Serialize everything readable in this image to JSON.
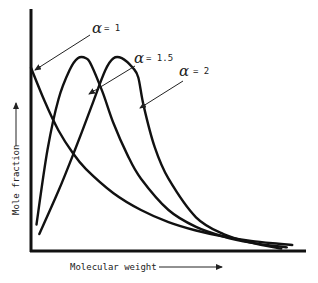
{
  "chart_data": {
    "type": "line",
    "title": "",
    "xlabel": "Molecular weight",
    "ylabel": "Mole fraction",
    "xlim": [
      0,
      1
    ],
    "ylim": [
      0,
      1
    ],
    "grid": false,
    "ticks": "none",
    "series": [
      {
        "name": "α = 1",
        "alpha_symbol": "α",
        "alpha_value": "= 1",
        "x": [
          0.0,
          0.05,
          0.1,
          0.15,
          0.2,
          0.3,
          0.4,
          0.5,
          0.6,
          0.7,
          0.8,
          0.9,
          0.95
        ],
        "y": [
          0.76,
          0.62,
          0.5,
          0.41,
          0.34,
          0.24,
          0.17,
          0.12,
          0.085,
          0.06,
          0.042,
          0.03,
          0.025
        ]
      },
      {
        "name": "α = 1.5",
        "alpha_symbol": "α",
        "alpha_value": "= 1.5",
        "x": [
          0.02,
          0.06,
          0.1,
          0.14,
          0.17,
          0.2,
          0.22,
          0.26,
          0.3,
          0.35,
          0.4,
          0.5,
          0.6,
          0.7,
          0.8,
          0.93
        ],
        "y": [
          0.11,
          0.42,
          0.63,
          0.75,
          0.8,
          0.8,
          0.77,
          0.66,
          0.53,
          0.4,
          0.3,
          0.17,
          0.1,
          0.06,
          0.035,
          0.015
        ]
      },
      {
        "name": "α = 2",
        "alpha_symbol": "α",
        "alpha_value": "= 2",
        "x": [
          0.03,
          0.1,
          0.16,
          0.22,
          0.27,
          0.3,
          0.33,
          0.37,
          0.39,
          0.41,
          0.45,
          0.5,
          0.6,
          0.7,
          0.8,
          0.91
        ],
        "y": [
          0.07,
          0.25,
          0.42,
          0.6,
          0.75,
          0.8,
          0.8,
          0.76,
          0.72,
          0.6,
          0.43,
          0.3,
          0.14,
          0.07,
          0.035,
          0.01
        ]
      }
    ],
    "annotations": [
      {
        "text": "α = 1",
        "points_to_series": "α = 1",
        "location": "top-center"
      },
      {
        "text": "α = 1.5",
        "points_to_series": "α = 1.5",
        "location": "top-right"
      },
      {
        "text": "α = 2",
        "points_to_series": "α = 2",
        "location": "right"
      }
    ]
  }
}
